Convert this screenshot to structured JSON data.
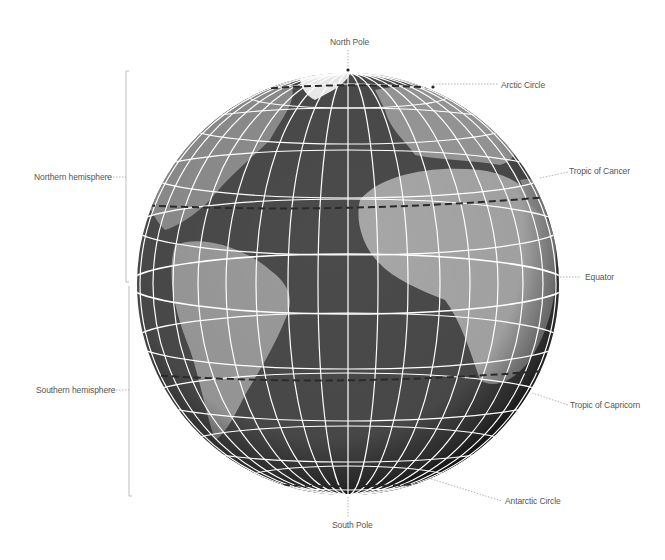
{
  "diagram": {
    "labels": {
      "north_pole": "North Pole",
      "south_pole": "South Pole",
      "arctic_circle": "Arctic Circle",
      "tropic_of_cancer": "Tropic of Cancer",
      "equator": "Equator",
      "tropic_of_capricorn": "Tropic of Capricorn",
      "antarctic_circle": "Antarctic Circle",
      "northern_hemisphere": "Northern hemisphere",
      "southern_hemisphere": "Southern hemisphere"
    },
    "colors": {
      "ocean": "#4a4a4a",
      "land": "#9a9a9a",
      "ice": "#f2f2f2",
      "grid": "#ffffff",
      "special_lines": "#2a2a2a",
      "leader": "#999999",
      "text": "#555555"
    }
  }
}
